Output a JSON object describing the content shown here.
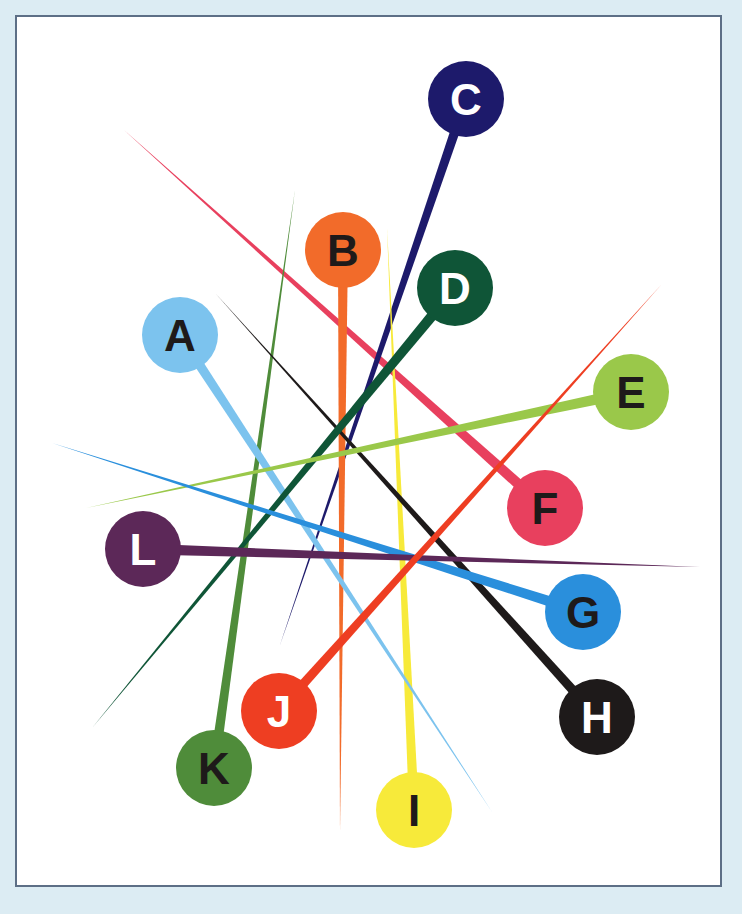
{
  "puzzle": {
    "frame": {
      "background": "#ffffff",
      "border_color": "#5d6f86",
      "page_background": "#dcecf3"
    },
    "pins": [
      {
        "label": "A",
        "cx": 180,
        "cy": 335,
        "r": 38,
        "color": "#7cc3ee",
        "text_color": "#1e1a1a",
        "tip_x": 492,
        "tip_y": 812,
        "width": 10
      },
      {
        "label": "B",
        "cx": 343,
        "cy": 250,
        "r": 38,
        "color": "#f26b2a",
        "text_color": "#1e1a1a",
        "tip_x": 340,
        "tip_y": 832,
        "width": 10
      },
      {
        "label": "C",
        "cx": 466,
        "cy": 99,
        "r": 38,
        "color": "#1d1a6b",
        "text_color": "#ffffff",
        "tip_x": 280,
        "tip_y": 645,
        "width": 10
      },
      {
        "label": "D",
        "cx": 455,
        "cy": 288,
        "r": 38,
        "color": "#0f5537",
        "text_color": "#ffffff",
        "tip_x": 92,
        "tip_y": 728,
        "width": 11
      },
      {
        "label": "E",
        "cx": 631,
        "cy": 392,
        "r": 38,
        "color": "#9ac84a",
        "text_color": "#1e1a1a",
        "tip_x": 86,
        "tip_y": 508,
        "width": 11
      },
      {
        "label": "F",
        "cx": 545,
        "cy": 508,
        "r": 38,
        "color": "#e8405e",
        "text_color": "#1e1a1a",
        "tip_x": 124,
        "tip_y": 130,
        "width": 11
      },
      {
        "label": "G",
        "cx": 583,
        "cy": 612,
        "r": 38,
        "color": "#2a8fdc",
        "text_color": "#1e1a1a",
        "tip_x": 52,
        "tip_y": 443,
        "width": 11
      },
      {
        "label": "H",
        "cx": 597,
        "cy": 717,
        "r": 38,
        "color": "#1e1a1a",
        "text_color": "#ffffff",
        "tip_x": 216,
        "tip_y": 294,
        "width": 10
      },
      {
        "label": "I",
        "cx": 414,
        "cy": 810,
        "r": 38,
        "color": "#f7ea3a",
        "text_color": "#1e1a1a",
        "tip_x": 387,
        "tip_y": 228,
        "width": 10
      },
      {
        "label": "J",
        "cx": 279,
        "cy": 711,
        "r": 38,
        "color": "#ee3e22",
        "text_color": "#ffffff",
        "tip_x": 661,
        "tip_y": 285,
        "width": 10
      },
      {
        "label": "K",
        "cx": 214,
        "cy": 768,
        "r": 38,
        "color": "#4f8c3a",
        "text_color": "#1e1a1a",
        "tip_x": 295,
        "tip_y": 190,
        "width": 10
      },
      {
        "label": "L",
        "cx": 143,
        "cy": 549,
        "r": 38,
        "color": "#5c2858",
        "text_color": "#ffffff",
        "tip_x": 700,
        "tip_y": 567,
        "width": 11
      }
    ]
  }
}
